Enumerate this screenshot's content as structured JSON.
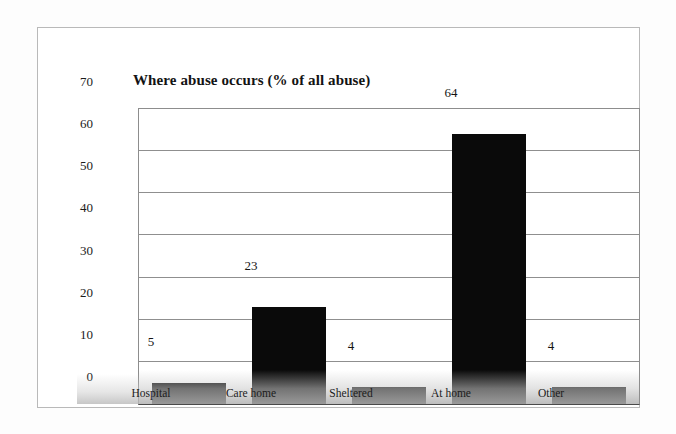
{
  "chart_data": {
    "type": "bar",
    "title": "Where abuse occurs (% of all abuse)",
    "xlabel": "",
    "ylabel": "",
    "categories": [
      "Hospital",
      "Care home",
      "Sheltered",
      "At home",
      "Other"
    ],
    "values": [
      5,
      23,
      4,
      64,
      4
    ],
    "value_labels": [
      "5",
      "23",
      "4",
      "64",
      "4"
    ],
    "ylim": [
      0,
      70
    ],
    "yticks": [
      0,
      10,
      20,
      30,
      40,
      50,
      60,
      70
    ],
    "ytick_labels": [
      "0",
      "10",
      "20",
      "30",
      "40",
      "50",
      "60",
      "70"
    ],
    "grid": true,
    "grid_axis": "y",
    "legend": false,
    "legend_position": "none",
    "bar_color": "#0a0a0a",
    "plot_border_color": "#8d8d8d",
    "axis_color": "#4a4a4a",
    "gridline_color": "#8f8f8f",
    "text_color": "#1b1b1b",
    "figure_frame_color": "#b9b9b9",
    "background_color": "#ffffff"
  }
}
